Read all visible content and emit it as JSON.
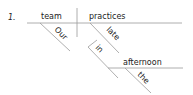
{
  "item_number": "1.",
  "subject": "team",
  "verb": "practices",
  "subject_modifier": "Our",
  "adverb": "late",
  "preposition": "in",
  "prep_object": "afternoon",
  "object_modifier": "the",
  "line_color": "#999999"
}
